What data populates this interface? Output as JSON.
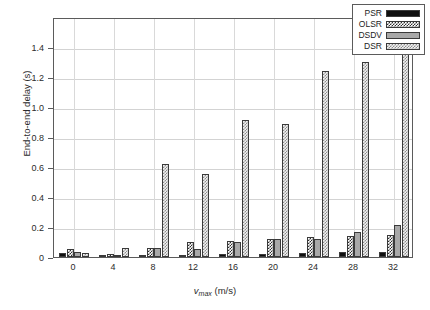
{
  "chart_data": {
    "type": "bar",
    "title": "",
    "xlabel": "v_max (m/s)",
    "ylabel": "End-to-end delay (s)",
    "categories": [
      "0",
      "4",
      "8",
      "12",
      "16",
      "20",
      "24",
      "28",
      "32"
    ],
    "xlim": [
      null,
      null
    ],
    "ylim": [
      0,
      1.6
    ],
    "grid": true,
    "legend_position": "top-right",
    "ytick_labels": [
      "0",
      "0.2",
      "0.4",
      "0.6",
      "0.8",
      "1.0",
      "1.2",
      "1.4"
    ],
    "ytick_values": [
      0,
      0.2,
      0.4,
      0.6,
      0.8,
      1.0,
      1.2,
      1.4
    ],
    "series": [
      {
        "name": "PSR",
        "fill": "solid-black",
        "values": [
          0.03,
          0.011,
          0.016,
          0.014,
          0.018,
          0.023,
          0.029,
          0.032,
          0.036
        ]
      },
      {
        "name": "OLSR",
        "fill": "dense-checker",
        "values": [
          0.055,
          0.018,
          0.063,
          0.098,
          0.11,
          0.118,
          0.131,
          0.138,
          0.148
        ]
      },
      {
        "name": "DSDV",
        "fill": "solid-gray",
        "values": [
          0.034,
          0.01,
          0.062,
          0.052,
          0.102,
          0.119,
          0.122,
          0.17,
          0.215
        ]
      },
      {
        "name": "DSR",
        "fill": "light-checker",
        "values": [
          0.03,
          0.057,
          0.622,
          0.555,
          0.913,
          0.886,
          1.24,
          1.297,
          1.412
        ]
      }
    ]
  },
  "axes": {
    "ylabel_text": "End-to-end delay (s)",
    "xlabel_prefix": "v",
    "xlabel_sub": "max",
    "xlabel_suffix": " (m/s)"
  },
  "legend": {
    "entries": [
      {
        "label": "PSR",
        "fill": "solid-black"
      },
      {
        "label": "OLSR",
        "fill": "dense-checker"
      },
      {
        "label": "DSDV",
        "fill": "solid-gray"
      },
      {
        "label": "DSR",
        "fill": "light-checker"
      }
    ]
  },
  "colors": {
    "axis": "#5b5b5b",
    "grid": "#d3d3d3",
    "text": "#2b2b2b",
    "psr": "#0f0f0f",
    "dsdv": "#a8a8a8",
    "olsr_pattern": "#2e2e2e",
    "dsr_pattern": "#8e8e8e",
    "background": "#ffffff"
  }
}
